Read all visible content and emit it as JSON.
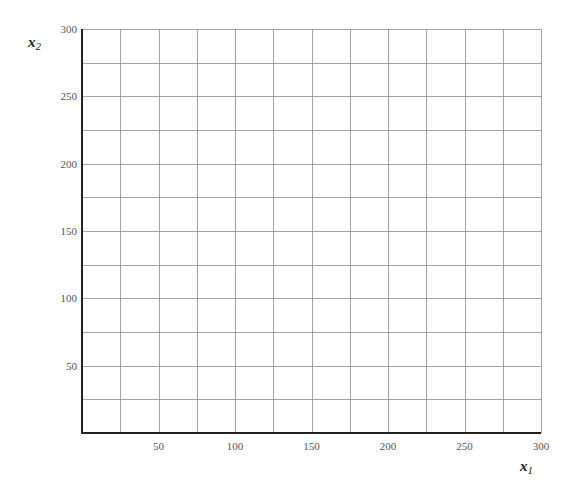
{
  "chart_data": {
    "type": "scatter",
    "title": "",
    "xlabel": "x1",
    "ylabel": "x2",
    "xlim": [
      0,
      300
    ],
    "ylim": [
      0,
      300
    ],
    "grid": true,
    "grid_step": 25,
    "x_ticks": [
      50,
      100,
      150,
      200,
      250,
      300
    ],
    "y_ticks": [
      50,
      100,
      150,
      200,
      250,
      300
    ],
    "series": [],
    "legend": null
  },
  "labels": {
    "x_main": "x",
    "x_sub": "1",
    "y_main": "x",
    "y_sub": "2"
  },
  "colors": {
    "grid": "#8a8a8a",
    "axis": "#222222",
    "tick_text": "#555555"
  }
}
